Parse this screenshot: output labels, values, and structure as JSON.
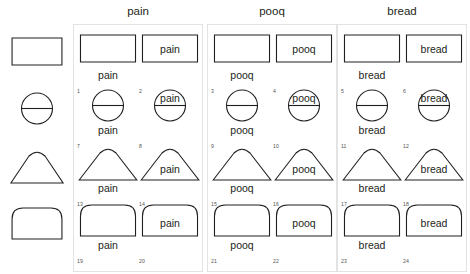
{
  "figure": {
    "shape_names": [
      "rectangle",
      "circle-with-diameter",
      "dome-triangle",
      "arch"
    ],
    "stroke_color": "#231f20",
    "panel_border_color": "#e3e3e3"
  },
  "headers": [
    {
      "label": "pain"
    },
    {
      "label": "pooq"
    },
    {
      "label": "bread"
    }
  ],
  "reference_column": {
    "shapes": [
      {
        "shape": "rectangle"
      },
      {
        "shape": "circle-with-diameter"
      },
      {
        "shape": "dome-triangle"
      },
      {
        "shape": "arch"
      }
    ]
  },
  "panels": [
    {
      "word": "pain",
      "cells": [
        {
          "num": "1",
          "shape": "rectangle",
          "word": "pain",
          "position": "below"
        },
        {
          "num": "2",
          "shape": "rectangle",
          "word": "pain",
          "position": "inside"
        },
        {
          "num": "7",
          "shape": "circle-with-diameter",
          "word": "pain",
          "position": "below"
        },
        {
          "num": "8",
          "shape": "circle-with-diameter",
          "word": "pain",
          "position": "inside"
        },
        {
          "num": "13",
          "shape": "dome-triangle",
          "word": "pain",
          "position": "below"
        },
        {
          "num": "14",
          "shape": "dome-triangle",
          "word": "pain",
          "position": "inside"
        },
        {
          "num": "19",
          "shape": "arch",
          "word": "pain",
          "position": "below"
        },
        {
          "num": "20",
          "shape": "arch",
          "word": "pain",
          "position": "inside"
        }
      ]
    },
    {
      "word": "pooq",
      "cells": [
        {
          "num": "3",
          "shape": "rectangle",
          "word": "pooq",
          "position": "below"
        },
        {
          "num": "4",
          "shape": "rectangle",
          "word": "pooq",
          "position": "inside"
        },
        {
          "num": "9",
          "shape": "circle-with-diameter",
          "word": "pooq",
          "position": "below"
        },
        {
          "num": "10",
          "shape": "circle-with-diameter",
          "word": "pooq",
          "position": "inside"
        },
        {
          "num": "15",
          "shape": "dome-triangle",
          "word": "pooq",
          "position": "below"
        },
        {
          "num": "16",
          "shape": "dome-triangle",
          "word": "pooq",
          "position": "inside"
        },
        {
          "num": "21",
          "shape": "arch",
          "word": "pooq",
          "position": "below"
        },
        {
          "num": "22",
          "shape": "arch",
          "word": "pooq",
          "position": "inside"
        }
      ]
    },
    {
      "word": "bread",
      "cells": [
        {
          "num": "5",
          "shape": "rectangle",
          "word": "bread",
          "position": "below"
        },
        {
          "num": "6",
          "shape": "rectangle",
          "word": "bread",
          "position": "inside"
        },
        {
          "num": "11",
          "shape": "circle-with-diameter",
          "word": "bread",
          "position": "below"
        },
        {
          "num": "12",
          "shape": "circle-with-diameter",
          "word": "bread",
          "position": "inside"
        },
        {
          "num": "17",
          "shape": "dome-triangle",
          "word": "bread",
          "position": "below"
        },
        {
          "num": "18",
          "shape": "dome-triangle",
          "word": "bread",
          "position": "inside"
        },
        {
          "num": "23",
          "shape": "arch",
          "word": "bread",
          "position": "below"
        },
        {
          "num": "24",
          "shape": "arch",
          "word": "bread",
          "position": "inside"
        }
      ]
    }
  ]
}
